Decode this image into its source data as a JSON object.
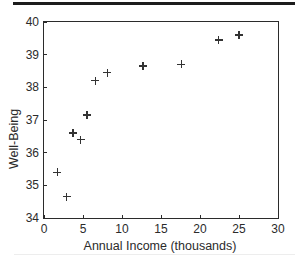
{
  "figure": {
    "colors": {
      "ink": "#2b2b2b",
      "marker": "#333333",
      "top_rule": "#1c1c1c"
    }
  },
  "chart_data": {
    "type": "scatter",
    "title": "",
    "xlabel": "Annual Income (thousands)",
    "ylabel": "Well-Being",
    "xlim": [
      0,
      30
    ],
    "ylim": [
      34,
      40
    ],
    "xticks": [
      0,
      5,
      10,
      15,
      20,
      25,
      30
    ],
    "yticks": [
      34,
      35,
      36,
      37,
      38,
      39,
      40
    ],
    "grid": false,
    "legend": null,
    "marker": "plus",
    "points": [
      {
        "x": 1.7,
        "y": 35.4
      },
      {
        "x": 2.9,
        "y": 34.65
      },
      {
        "x": 3.7,
        "y": 36.6
      },
      {
        "x": 4.7,
        "y": 36.4
      },
      {
        "x": 5.5,
        "y": 37.15
      },
      {
        "x": 6.6,
        "y": 38.2
      },
      {
        "x": 8.1,
        "y": 38.45
      },
      {
        "x": 12.7,
        "y": 38.65
      },
      {
        "x": 17.6,
        "y": 38.7
      },
      {
        "x": 22.4,
        "y": 39.45
      },
      {
        "x": 25.0,
        "y": 39.6
      }
    ]
  }
}
